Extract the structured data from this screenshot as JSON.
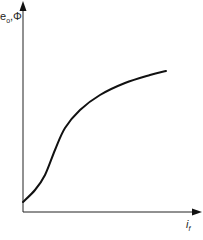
{
  "chart_data": {
    "type": "line",
    "title": "",
    "xlabel": "i_f",
    "ylabel": "e_o, Φ",
    "grid": false,
    "ticks": false,
    "series": [
      {
        "name": "magnetization curve",
        "points_px": [
          [
            23,
            202
          ],
          [
            35,
            190
          ],
          [
            45,
            175
          ],
          [
            55,
            150
          ],
          [
            65,
            128
          ],
          [
            80,
            110
          ],
          [
            100,
            95
          ],
          [
            125,
            83
          ],
          [
            150,
            75
          ],
          [
            166,
            71
          ]
        ],
        "x_norm": [
          0.0,
          0.08,
          0.15,
          0.22,
          0.29,
          0.39,
          0.53,
          0.7,
          0.88,
          1.0
        ],
        "y_norm": [
          0.05,
          0.11,
          0.19,
          0.32,
          0.44,
          0.53,
          0.61,
          0.68,
          0.72,
          0.74
        ]
      }
    ],
    "axis_color": "#222222",
    "curve_color": "#111111"
  },
  "labels": {
    "y_main": "e",
    "y_sub": "o",
    "y_sep": ",",
    "y_phi": "Φ",
    "x_main": "i",
    "x_sub": "f"
  }
}
